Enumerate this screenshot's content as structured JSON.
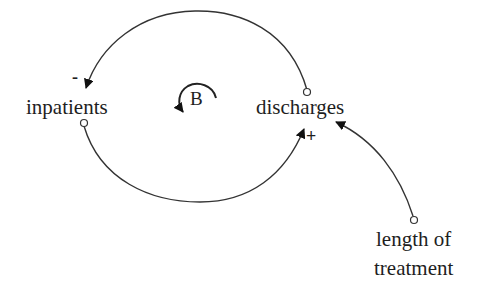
{
  "diagram": {
    "type": "causal-loop",
    "nodes": [
      {
        "id": "inpatients",
        "label": "inpatients"
      },
      {
        "id": "discharges",
        "label": "discharges"
      },
      {
        "id": "length_of_treatment",
        "label_line1": "length of",
        "label_line2": "treatment"
      }
    ],
    "links": [
      {
        "from": "discharges",
        "to": "inpatients",
        "polarity": "-"
      },
      {
        "from": "inpatients",
        "to": "discharges",
        "polarity": "+"
      },
      {
        "from": "length_of_treatment",
        "to": "discharges",
        "polarity": ""
      }
    ],
    "loop": {
      "label": "B",
      "meaning": "balancing"
    },
    "colors": {
      "line": "#333333",
      "text": "#1e1e1e",
      "background": "#ffffff"
    }
  }
}
